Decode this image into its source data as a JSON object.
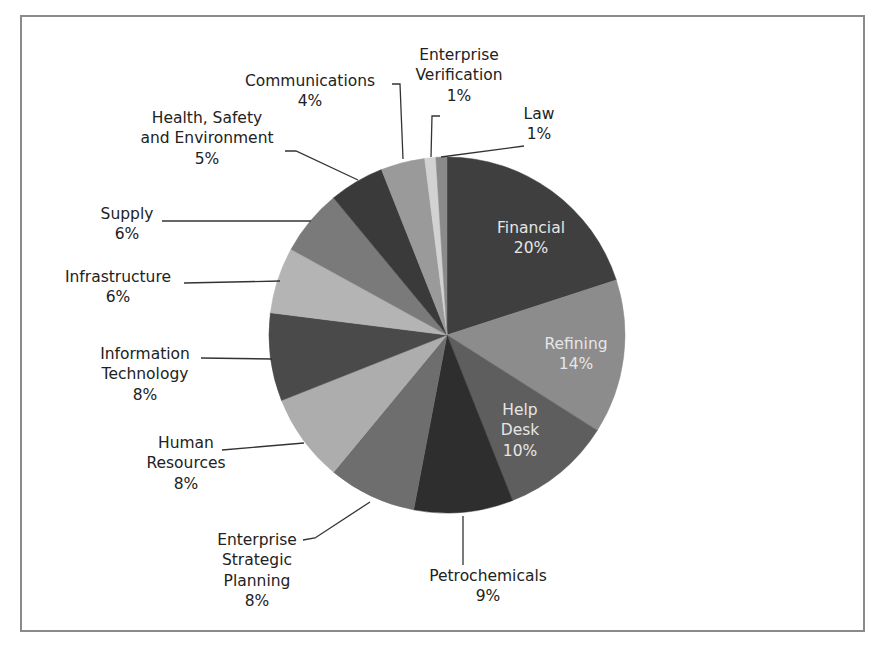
{
  "chart_data": {
    "type": "pie",
    "title": "",
    "start_angle_deg": 0,
    "direction": "clockwise",
    "center": [
      447,
      335
    ],
    "radius": 178,
    "categories": [
      "Financial",
      "Refining",
      "Help Desk",
      "Petrochemicals",
      "Enterprise Strategic Planning",
      "Human Resources",
      "Information Technology",
      "Infrastructure",
      "Supply",
      "Health, Safety and Environment",
      "Communications",
      "Enterprise Verification",
      "Law"
    ],
    "values": [
      20,
      14,
      10,
      9,
      8,
      8,
      8,
      6,
      6,
      5,
      4,
      1,
      1
    ],
    "value_labels": [
      "20%",
      "14%",
      "10%",
      "9%",
      "8%",
      "8%",
      "8%",
      "6%",
      "6%",
      "5%",
      "4%",
      "1%",
      "1%"
    ],
    "colors": [
      "#3f3f3f",
      "#8c8c8c",
      "#5e5e5e",
      "#2e2e2e",
      "#6e6e6e",
      "#adadad",
      "#4a4a4a",
      "#b4b4b4",
      "#7a7a7a",
      "#3a3a3a",
      "#9a9a9a",
      "#d2d2d2",
      "#8a8a8a"
    ],
    "legend": "none (data labels with leader lines)"
  },
  "labels": [
    {
      "lines": [
        "Financial",
        "20%"
      ],
      "x": 531,
      "y": 233,
      "inside": true
    },
    {
      "lines": [
        "Refining",
        "14%"
      ],
      "x": 576,
      "y": 349,
      "inside": true
    },
    {
      "lines": [
        "Help",
        "Desk",
        "10%"
      ],
      "x": 520,
      "y": 415,
      "inside": true
    },
    {
      "lines": [
        "Petrochemicals",
        "9%"
      ],
      "x": 488,
      "y": 581,
      "inside": false
    },
    {
      "lines": [
        "Enterprise",
        "Strategic",
        "Planning",
        "8%"
      ],
      "x": 257,
      "y": 545,
      "inside": false
    },
    {
      "lines": [
        "Human",
        "Resources",
        "8%"
      ],
      "x": 186,
      "y": 448,
      "inside": false
    },
    {
      "lines": [
        "Information",
        "Technology",
        "8%"
      ],
      "x": 145,
      "y": 359,
      "inside": false
    },
    {
      "lines": [
        "Infrastructure",
        "6%"
      ],
      "x": 118,
      "y": 282,
      "inside": false
    },
    {
      "lines": [
        "Supply",
        "6%"
      ],
      "x": 127,
      "y": 219,
      "inside": false
    },
    {
      "lines": [
        "Health, Safety",
        "and Environment",
        "5%"
      ],
      "x": 207,
      "y": 123,
      "inside": false
    },
    {
      "lines": [
        "Communications",
        "4%"
      ],
      "x": 310,
      "y": 86,
      "inside": false
    },
    {
      "lines": [
        "Enterprise",
        "Verification",
        "1%"
      ],
      "x": 459,
      "y": 60,
      "inside": false
    },
    {
      "lines": [
        "Law",
        "1%"
      ],
      "x": 539,
      "y": 119,
      "inside": false
    }
  ],
  "leaders": [
    {
      "name": "petrochemicals",
      "points": [
        [
          463,
          516
        ],
        [
          463,
          565
        ]
      ]
    },
    {
      "name": "enterprise-strategic-planning",
      "points": [
        [
          370,
          502
        ],
        [
          315,
          538
        ],
        [
          303,
          540
        ]
      ]
    },
    {
      "name": "human-resources",
      "points": [
        [
          304,
          443
        ],
        [
          222,
          450
        ]
      ]
    },
    {
      "name": "information-technology",
      "points": [
        [
          272,
          359
        ],
        [
          201,
          358
        ]
      ]
    },
    {
      "name": "infrastructure",
      "points": [
        [
          280,
          281
        ],
        [
          184,
          283
        ]
      ]
    },
    {
      "name": "supply",
      "points": [
        [
          311,
          221
        ],
        [
          162,
          221
        ]
      ]
    },
    {
      "name": "health-safety-environment",
      "points": [
        [
          358,
          180
        ],
        [
          296,
          151
        ],
        [
          285,
          151
        ]
      ]
    },
    {
      "name": "communications",
      "points": [
        [
          403,
          159
        ],
        [
          400,
          84
        ],
        [
          392,
          84
        ]
      ]
    },
    {
      "name": "enterprise-verification",
      "points": [
        [
          431,
          157
        ],
        [
          432,
          116
        ],
        [
          440,
          116
        ]
      ]
    },
    {
      "name": "law",
      "points": [
        [
          441,
          157
        ],
        [
          524,
          146
        ]
      ]
    }
  ]
}
